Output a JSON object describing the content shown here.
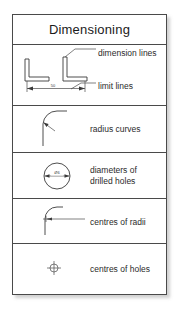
{
  "card": {
    "title": "Dimensioning"
  },
  "rows": [
    {
      "id": "dimension-limit-lines",
      "labels": [
        {
          "name": "dimension-lines-label",
          "text": "dimension lines"
        },
        {
          "name": "limit-lines-label",
          "text": "limit lines"
        }
      ],
      "figure": {
        "name": "angle-profiles-dimension-figure",
        "dimension_value": "50"
      }
    },
    {
      "id": "radius-curves",
      "labels": [
        {
          "name": "radius-curves-label",
          "text": "radius curves"
        }
      ],
      "figure": {
        "name": "radius-curve-figure"
      }
    },
    {
      "id": "diameters-of-drilled-holes",
      "labels": [
        {
          "name": "diameters-label",
          "text": "diameters of\ndrilled holes"
        }
      ],
      "figure": {
        "name": "circle-diameter-figure",
        "diameter_value": "Ø6"
      }
    },
    {
      "id": "centres-of-radii",
      "labels": [
        {
          "name": "centres-of-radii-label",
          "text": "centres of radii"
        }
      ],
      "figure": {
        "name": "centre-of-radius-figure"
      }
    },
    {
      "id": "centres-of-holes",
      "labels": [
        {
          "name": "centres-of-holes-label",
          "text": "centres of holes"
        }
      ],
      "figure": {
        "name": "centre-mark-figure"
      }
    }
  ],
  "colors": {
    "border": "#4a4a4a",
    "ink": "#3a3a3a",
    "text": "#1b1b1b",
    "background": "#ffffff"
  }
}
